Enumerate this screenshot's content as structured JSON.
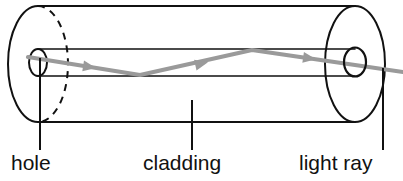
{
  "figure": {
    "type": "optical-fibre-cross-section-diagram",
    "background_color": "#ffffff",
    "ink_color": "#111111",
    "ray_color": "#9a9a9a",
    "width": 403,
    "height": 181
  },
  "labels": {
    "hole": "hole",
    "cladding": "cladding",
    "light_ray": "light ray"
  },
  "geometry": {
    "cylinder": {
      "left_center_x": 38,
      "right_center_x": 355,
      "top_y": 6,
      "bottom_y": 122,
      "ellipse_rx": 30,
      "ellipse_ry": 58,
      "left_face_back_half": "dashed",
      "right_face": "solid"
    },
    "hole_tube": {
      "top_y": 49,
      "bottom_y": 76,
      "left_ellipse_rx": 9,
      "right_ellipse_rx": 11,
      "ellipse_ry": 13.5
    },
    "ray_path": [
      [
        28,
        57
      ],
      [
        140,
        75
      ],
      [
        252,
        50
      ],
      [
        355,
        65
      ],
      [
        403,
        72
      ]
    ],
    "ray_arrowheads": [
      {
        "x": 92,
        "y": 67,
        "angle": 9
      },
      {
        "x": 202,
        "y": 61,
        "angle": -12
      },
      {
        "x": 311,
        "y": 59,
        "angle": 8
      }
    ],
    "leader_lines": [
      {
        "name": "hole-leader",
        "x": 40,
        "y1": 58,
        "y2": 150
      },
      {
        "name": "cladding-leader",
        "x": 192,
        "y1": 100,
        "y2": 150
      },
      {
        "name": "light-ray-leader",
        "x": 383,
        "y1": 68,
        "y2": 150
      }
    ]
  }
}
